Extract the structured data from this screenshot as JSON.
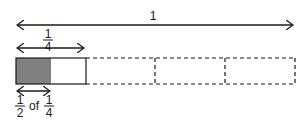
{
  "diagram": {
    "whole_label": "1",
    "quarter_label": {
      "numerator": "1",
      "denominator": "4"
    },
    "bottom_label": {
      "first": {
        "numerator": "1",
        "denominator": "2"
      },
      "word": "of",
      "second": {
        "numerator": "1",
        "denominator": "4"
      }
    },
    "bar": {
      "segments": 4,
      "solid_segments": 1,
      "shaded_fraction_of_segment": 0.5,
      "shade_color": "#808080",
      "line_color": "#1a1a1a"
    }
  }
}
